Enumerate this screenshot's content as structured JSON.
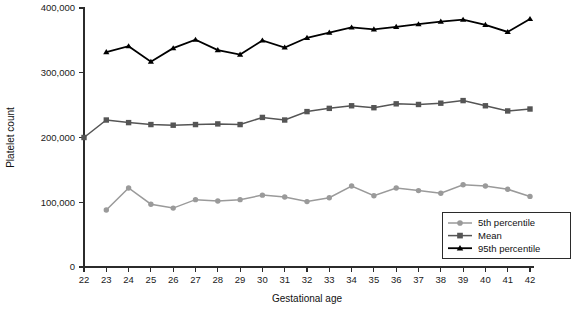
{
  "chart_data": {
    "type": "line",
    "title": "",
    "xlabel": "Gestational age",
    "ylabel": "Platelet count",
    "xlim": [
      21.5,
      42.6
    ],
    "ylim": [
      0,
      400000
    ],
    "grid": false,
    "legend_position": "bottom-right",
    "x": [
      22,
      23,
      24,
      25,
      26,
      27,
      28,
      29,
      30,
      31,
      32,
      33,
      34,
      35,
      36,
      37,
      38,
      39,
      40,
      41,
      42
    ],
    "x_tick_labels": [
      "22",
      "23",
      "24",
      "25",
      "26",
      "27",
      "28",
      "29",
      "30",
      "31",
      "32",
      "33",
      "34",
      "35",
      "36",
      "37",
      "38",
      "39",
      "40",
      "41",
      "42"
    ],
    "y_ticks": [
      0,
      100000,
      200000,
      300000,
      400000
    ],
    "y_tick_labels": [
      "0",
      "100,000",
      "200,000",
      "300,000",
      "400,000"
    ],
    "series": [
      {
        "name": "5th percentile",
        "color": "#9a9a9a",
        "marker": "circle",
        "x": [
          23,
          24,
          25,
          26,
          27,
          28,
          29,
          30,
          31,
          32,
          33,
          34,
          35,
          36,
          37,
          38,
          39,
          40,
          41,
          42
        ],
        "values": [
          88000,
          122000,
          97000,
          91000,
          104000,
          102000,
          104000,
          111000,
          108000,
          101000,
          107000,
          125000,
          110000,
          122000,
          118000,
          114000,
          127000,
          125000,
          120000,
          109000
        ]
      },
      {
        "name": "Mean",
        "color": "#555555",
        "marker": "square",
        "x": [
          22,
          23,
          24,
          25,
          26,
          27,
          28,
          29,
          30,
          31,
          32,
          33,
          34,
          35,
          36,
          37,
          38,
          39,
          40,
          41,
          42
        ],
        "values": [
          200000,
          227000,
          223000,
          220000,
          219000,
          220000,
          221000,
          220000,
          231000,
          227000,
          240000,
          245000,
          249000,
          246000,
          252000,
          251000,
          253000,
          257000,
          249000,
          241000,
          244000
        ]
      },
      {
        "name": "95th percentile",
        "color": "#000000",
        "marker": "triangle",
        "x": [
          23,
          24,
          25,
          26,
          27,
          28,
          29,
          30,
          31,
          32,
          33,
          34,
          35,
          36,
          37,
          38,
          39,
          40,
          41,
          42
        ],
        "values": [
          332000,
          341000,
          317000,
          338000,
          351000,
          335000,
          328000,
          350000,
          339000,
          354000,
          362000,
          370000,
          367000,
          371000,
          375000,
          379000,
          382000,
          374000,
          363000,
          383000
        ]
      }
    ]
  },
  "legend": {
    "items": [
      {
        "label": "5th percentile"
      },
      {
        "label": "Mean"
      },
      {
        "label": "95th percentile"
      }
    ]
  },
  "caption": {
    "text": ""
  }
}
